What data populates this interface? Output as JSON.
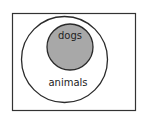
{
  "diagram": {
    "type": "euler",
    "universe": {
      "label": "",
      "stroke": "#333333",
      "fill": "#ffffff"
    },
    "sets": [
      {
        "id": "animals",
        "label": "animals",
        "fill": "#ffffff",
        "stroke": "#2a2a2a"
      },
      {
        "id": "dogs",
        "label": "dogs",
        "fill": "#a8a8a8",
        "stroke": "#2a2a2a",
        "subset_of": "animals"
      }
    ]
  }
}
